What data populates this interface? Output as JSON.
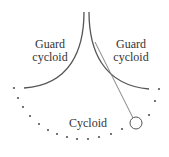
{
  "diagram": {
    "labels": {
      "left_guard_line1": "Guard",
      "left_guard_line2": "cycloid",
      "right_guard_line1": "Guard",
      "right_guard_line2": "cycloid",
      "cycloid": "Cycloid"
    },
    "colors": {
      "curve": "#555555",
      "dots": "#555555",
      "string": "#777777",
      "text": "#333333"
    },
    "dots": [
      [
        14,
        88
      ],
      [
        18,
        98
      ],
      [
        23,
        107
      ],
      [
        30,
        116
      ],
      [
        39,
        124
      ],
      [
        48,
        130
      ],
      [
        57,
        134
      ],
      [
        67,
        137
      ],
      [
        77,
        139
      ],
      [
        88,
        139
      ],
      [
        99,
        137
      ],
      [
        111,
        134
      ],
      [
        122,
        129
      ],
      [
        149,
        115
      ],
      [
        155,
        101
      ],
      [
        159,
        89
      ]
    ]
  }
}
